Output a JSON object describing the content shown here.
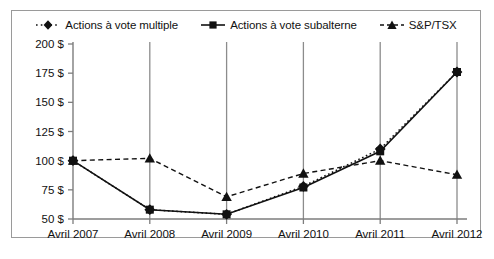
{
  "figure": {
    "border_color": "#9a9a9a",
    "background": "#ffffff"
  },
  "legend": {
    "items": [
      {
        "label": "Actions à vote multiple",
        "marker": "diamond-marker",
        "line": "dotted"
      },
      {
        "label": "Actions à vote subalterne",
        "marker": "square-marker",
        "line": "solid"
      },
      {
        "label": "S&P/TSX",
        "marker": "triangle-marker",
        "line": "dashed"
      }
    ]
  },
  "chart_data": {
    "type": "line",
    "title": "",
    "xlabel": "",
    "ylabel": "",
    "categories": [
      "Avril 2007",
      "Avril 2008",
      "Avril 2009",
      "Avril 2010",
      "Avril 2011",
      "Avril 2012"
    ],
    "yticks": [
      50,
      75,
      100,
      125,
      150,
      175,
      200
    ],
    "ytick_labels": [
      "50 $",
      "75 $",
      "100 $",
      "125 $",
      "150 $",
      "175 $",
      "200 $"
    ],
    "ylim": [
      50,
      200
    ],
    "grid": "vertical",
    "legend_position": "top-center",
    "series": [
      {
        "name": "Actions à vote multiple",
        "marker": "diamond",
        "line_style": "dotted",
        "color": "#111111",
        "values": [
          100,
          58,
          54,
          78,
          110,
          176
        ]
      },
      {
        "name": "Actions à vote subalterne",
        "marker": "square",
        "line_style": "solid",
        "color": "#111111",
        "values": [
          100,
          58,
          54,
          77,
          108,
          176
        ]
      },
      {
        "name": "S&P/TSX",
        "marker": "triangle",
        "line_style": "dashed",
        "color": "#111111",
        "values": [
          100,
          102,
          69,
          89,
          100,
          88
        ]
      }
    ]
  }
}
